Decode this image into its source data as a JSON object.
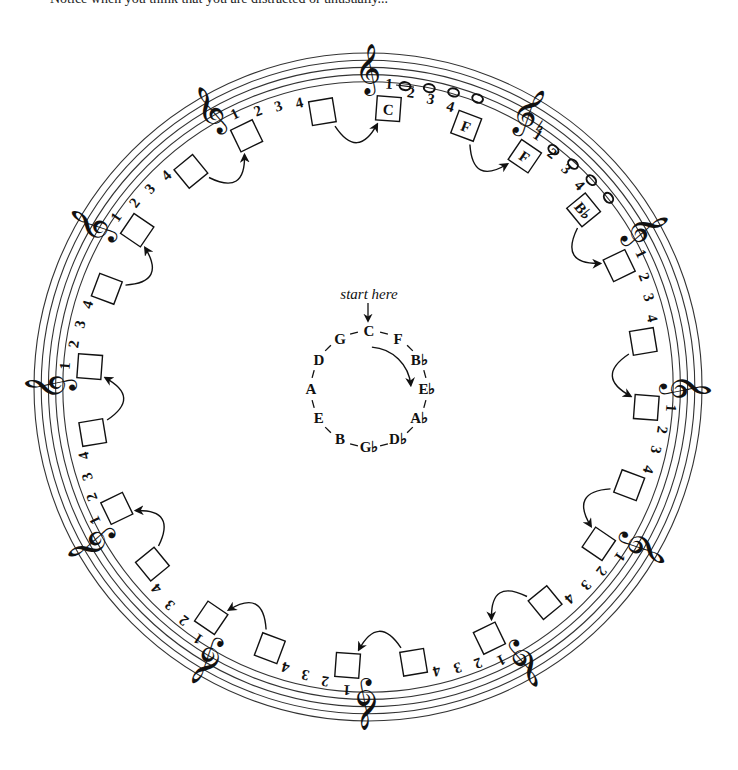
{
  "header": {
    "cut_off_text": "Notice when you think that you are distracted or unusually..."
  },
  "diagram": {
    "center": [
      368,
      387
    ],
    "staff": {
      "outer_radius": 334,
      "line_count": 5,
      "line_spacing": 7.2,
      "color": "#333333"
    },
    "clef_glyph": "𝄞",
    "clef_count": 12,
    "beat_numbers": [
      "1",
      "2",
      "3",
      "4"
    ],
    "first_segment_notes": {
      "count": 4,
      "glyph": "o"
    },
    "first_segment_flat": "♭",
    "boxes": [
      {
        "segment": 0,
        "slot": "start",
        "label": "C"
      },
      {
        "segment": 0,
        "slot": "end",
        "label": "F"
      },
      {
        "segment": 1,
        "slot": "start",
        "label": "F"
      },
      {
        "segment": 1,
        "slot": "end",
        "label": "B♭"
      }
    ],
    "inner_circle": {
      "start_label": "start here",
      "notes": [
        "C",
        "F",
        "B♭",
        "E♭",
        "A♭",
        "D♭",
        "G♭",
        "B",
        "E",
        "A",
        "D",
        "G"
      ],
      "radius": 58
    }
  }
}
